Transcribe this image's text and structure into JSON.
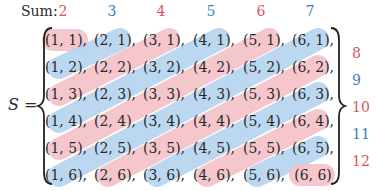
{
  "header": {
    "sum_label": "Sum:",
    "column_sums": [
      {
        "value": "2",
        "color": "#d9535f"
      },
      {
        "value": "3",
        "color": "#3b7fc4"
      },
      {
        "value": "4",
        "color": "#d9535f"
      },
      {
        "value": "5",
        "color": "#3b7fc4"
      },
      {
        "value": "6",
        "color": "#d9535f"
      },
      {
        "value": "7",
        "color": "#3b7fc4"
      }
    ]
  },
  "set": {
    "name": "S",
    "equals": "="
  },
  "right_sums": [
    {
      "value": "8",
      "color": "#d9535f"
    },
    {
      "value": "9",
      "color": "#3b7fc4"
    },
    {
      "value": "10",
      "color": "#d9535f"
    },
    {
      "value": "11",
      "color": "#3b7fc4"
    },
    {
      "value": "12",
      "color": "#d9535f"
    }
  ],
  "colors": {
    "pink_band": "#f4c2c8",
    "blue_band": "#b5d4ef",
    "pink_text": "#d9535f",
    "blue_text": "#3b7fc4"
  },
  "rows": [
    [
      "(1, 1),",
      "(2, 1),",
      "(3, 1),",
      "(4, 1),",
      "(5, 1),",
      "(6, 1),"
    ],
    [
      "(1, 2),",
      "(2, 2),",
      "(3, 2),",
      "(4, 2),",
      "(5, 2),",
      "(6, 2),"
    ],
    [
      "(1, 3),",
      "(2, 3),",
      "(3, 3),",
      "(4, 3),",
      "(5, 3),",
      "(6, 3),"
    ],
    [
      "(1, 4),",
      "(2, 4),",
      "(3, 4),",
      "(4, 4),",
      "(5, 4),",
      "(6, 4),"
    ],
    [
      "(1, 5),",
      "(2, 5),",
      "(3, 5),",
      "(4, 5),",
      "(5, 5),",
      "(6, 5),"
    ],
    [
      "(1, 6),",
      "(2, 6),",
      "(3, 6),",
      "(4, 6),",
      "(5, 6),",
      "(6, 6)"
    ]
  ]
}
